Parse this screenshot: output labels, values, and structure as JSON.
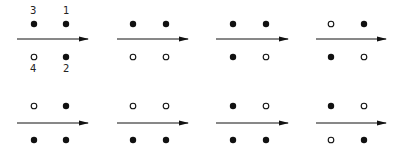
{
  "diagram": {
    "labels": {
      "pos1": "1",
      "pos2": "2",
      "pos3": "3",
      "pos4": "4"
    },
    "colors": {
      "ink": "#111111",
      "background": "#ffffff"
    },
    "panels": [
      {
        "id": 1,
        "row": 0,
        "col": 0,
        "top_left": "filled",
        "top_right": "filled",
        "bottom_left": "open",
        "bottom_right": "filled",
        "labeled": true
      },
      {
        "id": 2,
        "row": 0,
        "col": 1,
        "top_left": "filled",
        "top_right": "filled",
        "bottom_left": "open",
        "bottom_right": "open",
        "labeled": false
      },
      {
        "id": 3,
        "row": 0,
        "col": 2,
        "top_left": "filled",
        "top_right": "filled",
        "bottom_left": "filled",
        "bottom_right": "open",
        "labeled": false
      },
      {
        "id": 4,
        "row": 0,
        "col": 3,
        "top_left": "open",
        "top_right": "filled",
        "bottom_left": "filled",
        "bottom_right": "open",
        "labeled": false
      },
      {
        "id": 5,
        "row": 1,
        "col": 0,
        "top_left": "open",
        "top_right": "filled",
        "bottom_left": "filled",
        "bottom_right": "filled",
        "labeled": false
      },
      {
        "id": 6,
        "row": 1,
        "col": 1,
        "top_left": "open",
        "top_right": "open",
        "bottom_left": "filled",
        "bottom_right": "filled",
        "labeled": false
      },
      {
        "id": 7,
        "row": 1,
        "col": 2,
        "top_left": "filled",
        "top_right": "open",
        "bottom_left": "filled",
        "bottom_right": "filled",
        "labeled": false
      },
      {
        "id": 8,
        "row": 1,
        "col": 3,
        "top_left": "filled",
        "top_right": "open",
        "bottom_left": "open",
        "bottom_right": "filled",
        "labeled": false
      }
    ]
  }
}
